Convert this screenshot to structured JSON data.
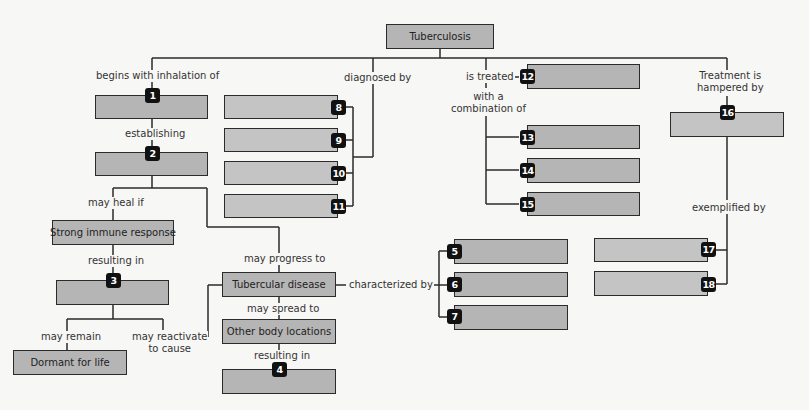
{
  "root": {
    "label": "Tuberculosis"
  },
  "links": {
    "begins_with": "begins with inhalation of",
    "establishing": "establishing",
    "may_heal_if": "may heal if",
    "resulting_in_1": "resulting in",
    "may_remain": "may remain",
    "may_reactivate_1": "may reactivate",
    "may_reactivate_2": "to cause",
    "diagnosed_by": "diagnosed by",
    "may_progress_to": "may progress to",
    "may_spread_to": "may spread to",
    "resulting_in_2": "resulting in",
    "characterized_by": "characterized by",
    "is_treated": "is treated",
    "with_a": "with a",
    "combination_of": "combination of",
    "treatment_is": "Treatment is",
    "hampered_by": "hampered by",
    "exemplified_by": "exemplified by"
  },
  "nodes": {
    "strong_immune": "Strong immune response",
    "dormant": "Dormant for life",
    "tubercular_disease": "Tubercular disease",
    "other_body": "Other body locations"
  },
  "blanks": {
    "b1": "1",
    "b2": "2",
    "b3": "3",
    "b4": "4",
    "b5": "5",
    "b6": "6",
    "b7": "7",
    "b8": "8",
    "b9": "9",
    "b10": "10",
    "b11": "11",
    "b12": "12",
    "b13": "13",
    "b14": "14",
    "b15": "15",
    "b16": "16",
    "b17": "17",
    "b18": "18"
  },
  "colors": {
    "box_fill": "#b5b5b5",
    "box_fill_light": "#c4c4c4",
    "badge": "#111111",
    "line": "#2b2b2b",
    "background": "#f7f7f5"
  }
}
